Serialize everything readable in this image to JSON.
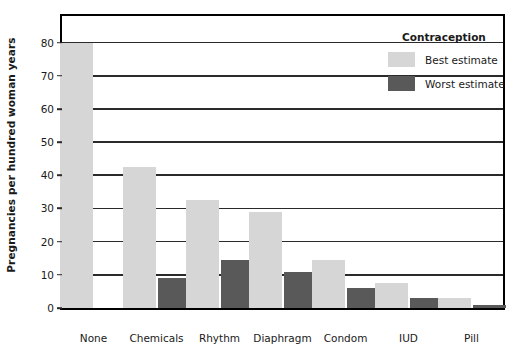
{
  "chart_data": {
    "type": "bar",
    "title": "",
    "xlabel": "",
    "ylabel": "Pregnancies per hundred woman years",
    "ylim": [
      0,
      88
    ],
    "yticks": [
      0,
      10,
      20,
      30,
      40,
      50,
      60,
      70,
      80
    ],
    "ytick_labels": [
      "0",
      "10",
      "20",
      "30",
      "40",
      "50",
      "60",
      "70",
      "80"
    ],
    "grid": true,
    "legend_position": "top-right",
    "legend_title": "Contraception",
    "categories": [
      "None",
      "Chemicals",
      "Rhythm",
      "Diaphragm",
      "Condom",
      "IUD",
      "Pill"
    ],
    "series": [
      {
        "name": "Best estimate",
        "color": "#d6d6d6",
        "values": [
          80,
          42.5,
          32.5,
          29,
          14.5,
          7.5,
          3
        ]
      },
      {
        "name": "Worst estimate",
        "color": "#595959",
        "values": [
          null,
          9,
          14.5,
          11,
          6,
          3,
          1
        ]
      }
    ]
  },
  "axes": {
    "y_title": "Pregnancies per hundred woman years"
  },
  "legend": {
    "title": "Contraception",
    "entries": [
      {
        "label": "Best estimate",
        "swatch": "best"
      },
      {
        "label": "Worst estimate",
        "swatch": "worst"
      }
    ]
  },
  "colors": {
    "best_estimate": "#d6d6d6",
    "worst_estimate": "#595959",
    "axis": "#000000",
    "gridline": "#2a2a2a",
    "background": "#ffffff"
  }
}
